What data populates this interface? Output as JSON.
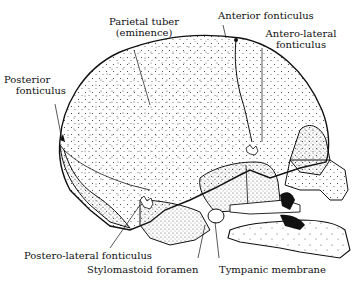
{
  "figure": {
    "labels": {
      "parietal_tuber_line1": "Parietal tuber",
      "parietal_tuber_line2": "(eminence)",
      "anterior_fonticulus": "Anterior fonticulus",
      "antero_lateral_line1": "Antero-lateral",
      "antero_lateral_line2": "fonticulus",
      "posterior_line1": "Posterior",
      "posterior_line2": "fonticulus",
      "postero_lateral": "Postero-lateral fonticulus",
      "stylomastoid": "Stylomastoid foramen",
      "tympanic": "Tympanic membrane"
    },
    "colors": {
      "ink": "#111111",
      "paper": "#ffffff"
    }
  }
}
